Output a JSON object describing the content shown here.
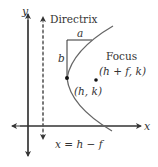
{
  "diagram": {
    "axes": {
      "x_label": "x",
      "y_label": "y"
    },
    "directrix": {
      "label": "Directrix",
      "equation": "x = h − f"
    },
    "vertex": {
      "label": "(h, k)"
    },
    "focus": {
      "label": "Focus",
      "coords": "(h + f, k)"
    },
    "dimensions": {
      "horizontal": "a",
      "vertical": "b"
    },
    "colors": {
      "axis": "#333333",
      "curve": "#666666",
      "text": "#333333"
    }
  }
}
